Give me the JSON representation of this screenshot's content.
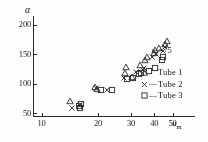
{
  "chart_data": {
    "type": "scatter",
    "title": "",
    "xlabel": "u_m",
    "ylabel": "α",
    "xscale": "log",
    "yscale": "linear",
    "xlim": [
      9,
      62
    ],
    "ylim": [
      45,
      215
    ],
    "grid": false,
    "annotations": [
      "s₁=75"
    ],
    "legend_position": "right",
    "xticks": [
      10,
      20,
      30,
      40,
      50
    ],
    "xtick_labels": [
      "10",
      "20",
      "30",
      "40",
      "50"
    ],
    "yticks": [
      50,
      100,
      150,
      200
    ],
    "ytick_labels": [
      "50",
      "100",
      "150",
      "200"
    ],
    "series": [
      {
        "name": "Tube 1",
        "marker": "triangle",
        "points": [
          [
            14.2,
            70
          ],
          [
            19.4,
            95
          ],
          [
            19.8,
            91
          ],
          [
            28.3,
            128
          ],
          [
            28.0,
            118
          ],
          [
            33.4,
            131
          ],
          [
            35.8,
            140
          ],
          [
            36.6,
            146
          ],
          [
            39.6,
            152
          ],
          [
            40.2,
            158
          ],
          [
            42.5,
            160
          ],
          [
            45.8,
            168
          ],
          [
            46.6,
            172
          ],
          [
            30.5,
            112
          ]
        ]
      },
      {
        "name": "Tube 2",
        "marker": "cross",
        "points": [
          [
            14.5,
            58
          ],
          [
            16.0,
            64
          ],
          [
            19.6,
            93
          ],
          [
            22.4,
            90
          ],
          [
            27.6,
            109
          ],
          [
            31.8,
            120
          ],
          [
            34.6,
            124
          ],
          [
            35.4,
            127
          ],
          [
            39.0,
            146
          ],
          [
            41.0,
            150
          ],
          [
            44.6,
            156
          ],
          [
            45.4,
            163
          ]
        ]
      },
      {
        "name": "Tube 3",
        "marker": "square",
        "points": [
          [
            15.8,
            62
          ],
          [
            16.2,
            66
          ],
          [
            16.0,
            58
          ],
          [
            20.8,
            90
          ],
          [
            23.8,
            89
          ],
          [
            28.6,
            108
          ],
          [
            30.8,
            110
          ],
          [
            33.0,
            117
          ],
          [
            34.0,
            118
          ],
          [
            37.6,
            122
          ],
          [
            40.4,
            127
          ],
          [
            43.8,
            140
          ],
          [
            44.6,
            146
          ]
        ]
      }
    ]
  },
  "axes": {
    "y_title": "α",
    "x_title_base": "u",
    "x_title_sub": "m"
  },
  "annotation": {
    "param_base": "s",
    "param_sub": "1",
    "param_value": "=75"
  },
  "legend": {
    "entries": [
      {
        "marker": "△",
        "dash": "",
        "label": "Tube 1"
      },
      {
        "marker": "×",
        "dash": "—",
        "label": "Tube 2"
      },
      {
        "marker": "□",
        "dash": "—",
        "label": "Tube 3"
      }
    ]
  },
  "colors": {
    "ink": "#2b2b2b",
    "paper": "#fdfdfb"
  }
}
